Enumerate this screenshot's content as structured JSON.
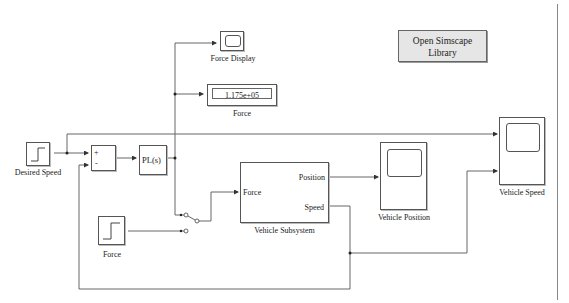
{
  "diagram": {
    "type": "simulink-model",
    "blocks": {
      "desired_speed": {
        "type": "step",
        "label": "Desired Speed"
      },
      "sum": {
        "type": "sum",
        "signs": [
          "+",
          "-"
        ]
      },
      "controller": {
        "type": "subsystem",
        "text": "PL(s)"
      },
      "force_display": {
        "type": "scope",
        "label": "Force Display"
      },
      "force_numeric": {
        "type": "display",
        "label": "Force",
        "value": "1.175e+05"
      },
      "force_step": {
        "type": "step",
        "label": "Force"
      },
      "manual_switch": {
        "type": "manual-switch"
      },
      "vehicle_subsystem": {
        "type": "subsystem",
        "label": "Vehicle Subsystem",
        "inports": [
          "Force"
        ],
        "outports": [
          "Position",
          "Speed"
        ]
      },
      "vehicle_position": {
        "type": "scope",
        "label": "Vehicle Position"
      },
      "vehicle_speed": {
        "type": "scope",
        "label": "Vehicle Speed"
      },
      "library_button": {
        "type": "button",
        "label_line1": "Open Simscape",
        "label_line2": "Library"
      }
    },
    "connections": [
      {
        "from": "Desired Speed",
        "to": "Sum (+)"
      },
      {
        "from": "Desired Speed",
        "to": "Vehicle Speed (in1)"
      },
      {
        "from": "Sum",
        "to": "PL(s)"
      },
      {
        "from": "PL(s)",
        "to": "Force Display"
      },
      {
        "from": "PL(s)",
        "to": "Force (Display)"
      },
      {
        "from": "PL(s)",
        "to": "Manual Switch (in1)"
      },
      {
        "from": "Force (Step)",
        "to": "Manual Switch (in2)"
      },
      {
        "from": "Manual Switch",
        "to": "Vehicle Subsystem / Force"
      },
      {
        "from": "Vehicle Subsystem / Position",
        "to": "Vehicle Position"
      },
      {
        "from": "Vehicle Subsystem / Speed",
        "to": "Vehicle Speed (in2)"
      },
      {
        "from": "Vehicle Subsystem / Speed",
        "to": "Sum (-)"
      }
    ],
    "colors": {
      "line": "#555555",
      "block_border": "#555555",
      "button_bg": "#e6e6e6"
    }
  }
}
